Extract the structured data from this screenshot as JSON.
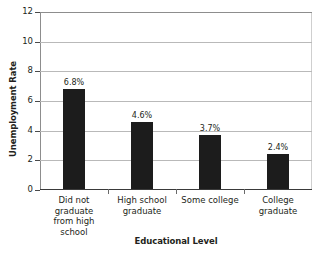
{
  "chart_data": {
    "type": "bar",
    "title": "",
    "xlabel": "Educational Level",
    "ylabel": "Unemployment Rate",
    "categories": [
      "Did not graduate from high school",
      "High school graduate",
      "Some college",
      "College graduate"
    ],
    "category_lines": [
      [
        "Did not",
        "graduate",
        "from high",
        "school"
      ],
      [
        "High school",
        "graduate"
      ],
      [
        "Some college"
      ],
      [
        "College",
        "graduate"
      ]
    ],
    "values": [
      6.8,
      4.6,
      3.7,
      2.4
    ],
    "value_labels": [
      "6.8%",
      "4.6%",
      "3.7%",
      "2.4%"
    ],
    "ylim": [
      0,
      12
    ],
    "yticks": [
      0,
      2,
      4,
      6,
      8,
      10,
      12
    ],
    "ytick_labels": [
      "0",
      "2",
      "4",
      "6",
      "8",
      "10",
      "12"
    ],
    "grid": true,
    "legend": false,
    "bar_color": "#1c1c1c",
    "background_color": "#ffffff",
    "gridline_color": "#b9b9b9",
    "axis_color": "#3a3a3a"
  }
}
